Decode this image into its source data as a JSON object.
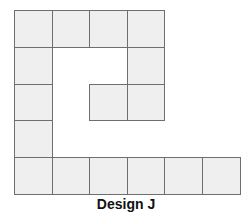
{
  "figure": {
    "caption": "Design J",
    "cell_color": "#efefef",
    "line_color": "#6e6e6e",
    "grid": {
      "cols": 6,
      "rows": 5,
      "filled_cells": [
        [
          0,
          0
        ],
        [
          0,
          1
        ],
        [
          0,
          2
        ],
        [
          0,
          3
        ],
        [
          1,
          0
        ],
        [
          1,
          3
        ],
        [
          2,
          0
        ],
        [
          2,
          2
        ],
        [
          2,
          3
        ],
        [
          3,
          0
        ],
        [
          4,
          0
        ],
        [
          4,
          1
        ],
        [
          4,
          2
        ],
        [
          4,
          3
        ],
        [
          4,
          4
        ],
        [
          4,
          5
        ]
      ]
    },
    "square_count": 16
  }
}
